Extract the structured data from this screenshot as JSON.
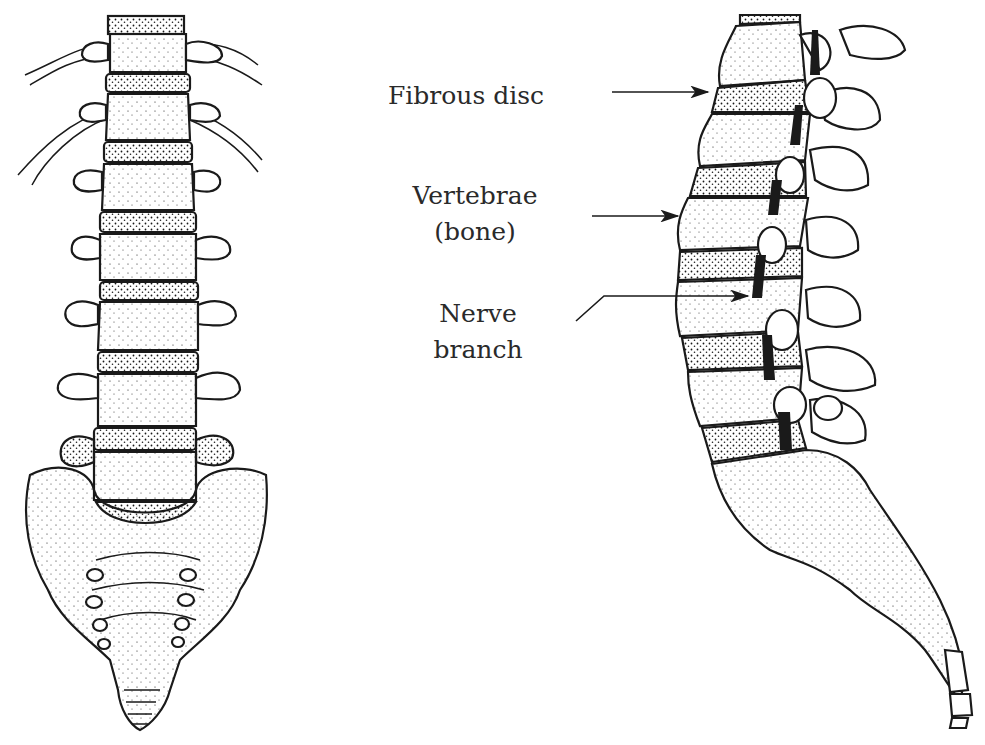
{
  "figure": {
    "views": [
      {
        "id": "front",
        "description": "Anterior view of lumbar spine and sacrum"
      },
      {
        "id": "side",
        "description": "Lateral view of lumbar spine, sacrum and coccyx"
      }
    ],
    "labels": {
      "fibrous_disc": "Fibrous disc",
      "vertebrae_line1": "Vertebrae",
      "vertebrae_line2": "(bone)",
      "nerve_line1": "Nerve",
      "nerve_line2": "branch"
    },
    "colors": {
      "ink": "#1a1a1a",
      "paper": "#ffffff",
      "text": "#2a2a2a"
    }
  }
}
